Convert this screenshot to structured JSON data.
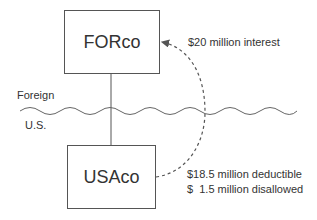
{
  "diagram": {
    "entities": {
      "foreign_parent": {
        "label": "FORco"
      },
      "us_subsidiary": {
        "label": "USAco"
      }
    },
    "regions": {
      "foreign": "Foreign",
      "us": "U.S."
    },
    "flows": {
      "interest_payment": {
        "label": "$20 million interest"
      },
      "deductible": "$18.5 million deductible",
      "disallowed": "$  1.5 million disallowed"
    },
    "colors": {
      "line": "#555555",
      "text": "#333333"
    }
  }
}
